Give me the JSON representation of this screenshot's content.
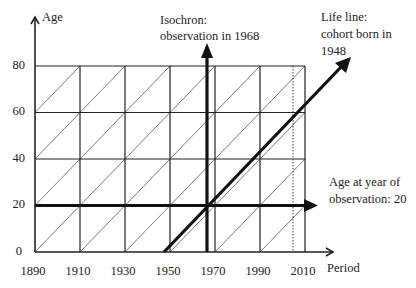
{
  "diagram": {
    "type": "Lexis diagram",
    "axes": {
      "y_label": "Age",
      "x_label": "Period",
      "y_ticks": [
        "0",
        "20",
        "40",
        "60",
        "80"
      ],
      "x_ticks": [
        "1890",
        "1910",
        "1930",
        "1950",
        "1970",
        "1990",
        "2010"
      ]
    },
    "annotations": {
      "isochron": {
        "line1": "Isochron:",
        "line2": "observation in 1968",
        "year": 1968
      },
      "life_line": {
        "line1": "Life line:",
        "line2": "cohort born in",
        "line3": "1948",
        "birth_year": 1948
      },
      "age_line": {
        "line1": "Age at year of",
        "line2": "observation: 20",
        "age": 20
      }
    },
    "reference_line": {
      "style": "dotted",
      "approx_year": 2005
    },
    "colors": {
      "ink": "#222222",
      "background": "#ffffff"
    }
  }
}
